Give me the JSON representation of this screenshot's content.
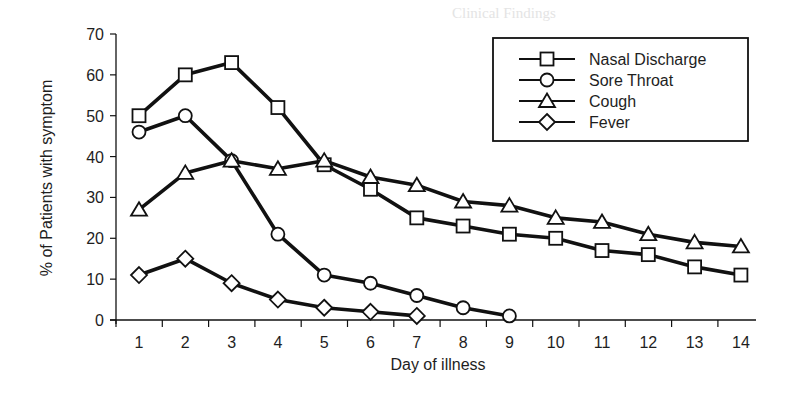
{
  "chart_data": {
    "type": "line",
    "title": "",
    "xlabel": "Day of illness",
    "ylabel": "% of Patients with symptom",
    "x": [
      1,
      2,
      3,
      4,
      5,
      6,
      7,
      8,
      9,
      10,
      11,
      12,
      13,
      14
    ],
    "xticks": [
      "1",
      "2",
      "3",
      "4",
      "5",
      "6",
      "7",
      "8",
      "9",
      "10",
      "11",
      "12",
      "13",
      "14"
    ],
    "yticks": [
      "0",
      "10",
      "20",
      "30",
      "40",
      "50",
      "60",
      "70"
    ],
    "ylim": [
      0,
      70
    ],
    "xlim": [
      0.2,
      14.9
    ],
    "grid": false,
    "legend_position": "upper right",
    "series": [
      {
        "name": "Nasal Discharge",
        "marker": "square",
        "values": [
          50,
          60,
          63,
          52,
          38,
          32,
          25,
          23,
          21,
          20,
          17,
          16,
          13,
          11
        ]
      },
      {
        "name": "Sore Throat",
        "marker": "circle",
        "values": [
          46,
          50,
          39,
          21,
          11,
          9,
          6,
          3,
          1,
          null,
          null,
          null,
          null,
          null
        ]
      },
      {
        "name": "Cough",
        "marker": "triangle",
        "values": [
          27,
          36,
          39,
          37,
          39,
          35,
          33,
          29,
          28,
          25,
          24,
          21,
          19,
          18
        ]
      },
      {
        "name": "Fever",
        "marker": "diamond",
        "values": [
          11,
          15,
          9,
          5,
          3,
          2,
          1,
          null,
          null,
          null,
          null,
          null,
          null,
          null
        ]
      }
    ]
  },
  "colors": {
    "line": "#111111",
    "marker_fill": "#ffffff",
    "text": "#1e1e1e",
    "background": "#ffffff"
  }
}
